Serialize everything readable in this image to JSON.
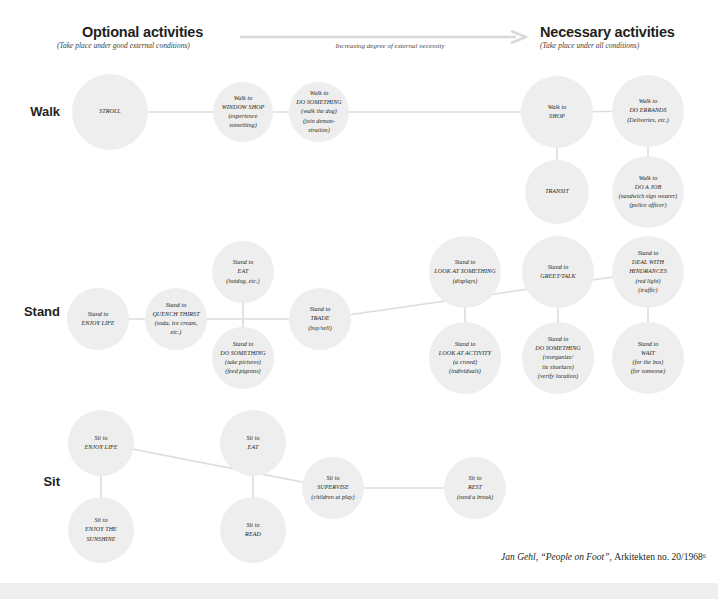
{
  "header": {
    "optional_title": "Optional activities",
    "optional_sub": "(Take place under good external conditions)",
    "necessary_title": "Necessary activities",
    "necessary_sub": "(Take place under all conditions)",
    "arrow_label": "Increasing degree of external necessity",
    "arrow_icon": "right-arrow-icon"
  },
  "rows": [
    {
      "id": "walk",
      "label": "Walk"
    },
    {
      "id": "stand",
      "label": "Stand"
    },
    {
      "id": "sit",
      "label": "Sit"
    }
  ],
  "colors": {
    "node_fill": "#eeeeee",
    "line": "#dcdcdc",
    "text": "#231f20",
    "bottom_bar": "#eeeeee",
    "background": "#ffffff"
  },
  "nodes": [
    {
      "id": "walk-stroll",
      "row": "walk",
      "cx": 110,
      "cy": 112,
      "r": 38,
      "text": "STROLL"
    },
    {
      "id": "walk-window-shop",
      "row": "walk",
      "cx": 243,
      "cy": 112,
      "r": 30,
      "text": "Walk to\nWINDOW SHOP\n(experience\nsomething)"
    },
    {
      "id": "walk-do-something",
      "row": "walk",
      "cx": 319,
      "cy": 112,
      "r": 30,
      "text": "Walk to\nDO SOMETHING\n(walk the dog)\n(join demon-\nstration)"
    },
    {
      "id": "walk-shop",
      "row": "walk",
      "cx": 557,
      "cy": 112,
      "r": 36,
      "text": "Walk to\nSHOP"
    },
    {
      "id": "walk-do-errands",
      "row": "walk",
      "cx": 648,
      "cy": 111,
      "r": 36,
      "text": "Walk to\nDO ERRANDS\n(Deliveries, etc.)"
    },
    {
      "id": "walk-transit",
      "row": "walk",
      "cx": 557,
      "cy": 192,
      "r": 32,
      "text": "TRANSIT"
    },
    {
      "id": "walk-do-a-job",
      "row": "walk",
      "cx": 648,
      "cy": 192,
      "r": 36,
      "text": "Walk to\nDO A JOB\n(sandwich sign wearer)\n(police officer)"
    },
    {
      "id": "stand-enjoy-life",
      "row": "stand",
      "cx": 98,
      "cy": 319,
      "r": 31,
      "text": "Stand to\nENJOY LIFE"
    },
    {
      "id": "stand-quench-thirst",
      "row": "stand",
      "cx": 176,
      "cy": 319,
      "r": 31,
      "text": "Stand to\nQUENCH THIRST\n(soda, ice cream,\netc.)"
    },
    {
      "id": "stand-eat",
      "row": "stand",
      "cx": 243,
      "cy": 272,
      "r": 31,
      "text": "Stand to\nEAT\n(hotdog, etc.)"
    },
    {
      "id": "stand-do-something",
      "row": "stand",
      "cx": 243,
      "cy": 358,
      "r": 31,
      "text": "Stand to\nDO SOMETHING\n(take pictures)\n(feed pigeons)"
    },
    {
      "id": "stand-trade",
      "row": "stand",
      "cx": 320,
      "cy": 319,
      "r": 31,
      "text": "Stand to\nTRADE\n(buy/sell)"
    },
    {
      "id": "stand-look-at-something",
      "row": "stand",
      "cx": 465,
      "cy": 272,
      "r": 36,
      "text": "Stand to\nLOOK AT SOMETHING\n(displays)"
    },
    {
      "id": "stand-look-at-activity",
      "row": "stand",
      "cx": 465,
      "cy": 358,
      "r": 36,
      "text": "Stand to\nLOOK AT ACTIVITY\n(a crowd)\n(individuals)"
    },
    {
      "id": "stand-greet-talk",
      "row": "stand",
      "cx": 558,
      "cy": 272,
      "r": 36,
      "text": "Stand to\nGREET/TALK"
    },
    {
      "id": "stand-do-something-2",
      "row": "stand",
      "cx": 558,
      "cy": 358,
      "r": 36,
      "text": "Stand to\nDO SOMETHING\n(reorganize/\ntie shoelace)\n(verify location)"
    },
    {
      "id": "stand-deal-hindrances",
      "row": "stand",
      "cx": 648,
      "cy": 272,
      "r": 36,
      "text": "Stand to\nDEAL WITH\nHINDRANCES\n(red light)\n(traffic)"
    },
    {
      "id": "stand-wait",
      "row": "stand",
      "cx": 648,
      "cy": 358,
      "r": 36,
      "text": "Stand to\nWAIT\n(for the bus)\n(for someone)"
    },
    {
      "id": "sit-enjoy-life",
      "row": "sit",
      "cx": 101,
      "cy": 443,
      "r": 33,
      "text": "Sit to\nENJOY LIFE"
    },
    {
      "id": "sit-enjoy-sunshine",
      "row": "sit",
      "cx": 101,
      "cy": 530,
      "r": 33,
      "text": "Sit to\nENJOY THE SUNSHINE"
    },
    {
      "id": "sit-eat",
      "row": "sit",
      "cx": 253,
      "cy": 443,
      "r": 33,
      "text": "Sit to\nEAT"
    },
    {
      "id": "sit-read",
      "row": "sit",
      "cx": 253,
      "cy": 530,
      "r": 33,
      "text": "Sit to\nREAD"
    },
    {
      "id": "sit-supervise",
      "row": "sit",
      "cx": 333,
      "cy": 488,
      "r": 31,
      "text": "Sit to\nSUPERVISE\n(children at play)"
    },
    {
      "id": "sit-rest",
      "row": "sit",
      "cx": 475,
      "cy": 488,
      "r": 31,
      "text": "Sit to\nREST\n(need a break)"
    }
  ],
  "links": [
    {
      "from": "walk-stroll",
      "to": "walk-window-shop"
    },
    {
      "from": "walk-window-shop",
      "to": "walk-do-something"
    },
    {
      "from": "walk-do-something",
      "to": "walk-shop"
    },
    {
      "from": "walk-shop",
      "to": "walk-do-errands"
    },
    {
      "from": "walk-shop",
      "to": "walk-transit"
    },
    {
      "from": "walk-do-errands",
      "to": "walk-do-a-job"
    },
    {
      "from": "stand-enjoy-life",
      "to": "stand-quench-thirst"
    },
    {
      "from": "stand-quench-thirst",
      "to": "stand-trade"
    },
    {
      "from": "stand-trade",
      "to": "stand-deal-hindrances"
    },
    {
      "from": "stand-eat",
      "to": "stand-do-something"
    },
    {
      "from": "stand-look-at-something",
      "to": "stand-look-at-activity"
    },
    {
      "from": "stand-greet-talk",
      "to": "stand-do-something-2"
    },
    {
      "from": "stand-deal-hindrances",
      "to": "stand-wait"
    },
    {
      "from": "sit-enjoy-life",
      "to": "sit-enjoy-sunshine"
    },
    {
      "from": "sit-eat",
      "to": "sit-read"
    },
    {
      "from": "sit-enjoy-life",
      "to": "sit-supervise"
    },
    {
      "from": "sit-supervise",
      "to": "sit-rest"
    }
  ],
  "credit": {
    "main": "Jan Gehl, “People on Foot”, ",
    "tail": "Arkitekten no. 20/1968⁶"
  }
}
